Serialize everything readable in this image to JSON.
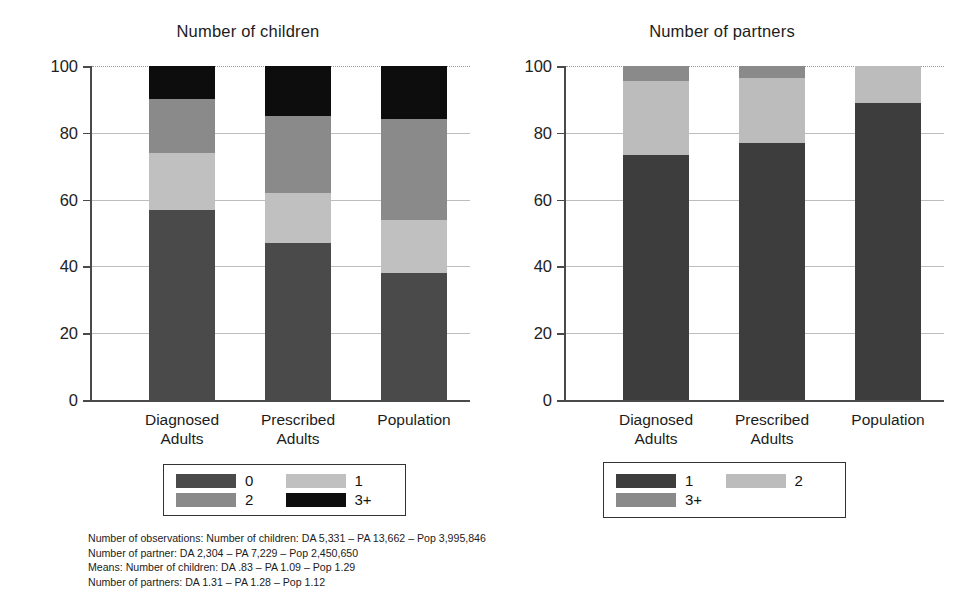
{
  "figure": {
    "width": 969,
    "height": 596,
    "background": "#ffffff"
  },
  "palette": {
    "cat_0_1": "#4a4a4a",
    "cat_1_2": "#c0c0c0",
    "cat_2_3plus": "#8a8a8a",
    "cat_3plus": "#0d0d0d",
    "axis": "#4a4a4a",
    "grid": "#bdbdbd"
  },
  "axis": {
    "tick_labels": [
      "0",
      "20",
      "40",
      "60",
      "80",
      "100"
    ],
    "tick_values": [
      0,
      20,
      40,
      60,
      80,
      100
    ],
    "ylim": [
      0,
      100
    ]
  },
  "categories": [
    "Diagnosed\nAdults",
    "Prescribed\nAdults",
    "Population"
  ],
  "legend_children": {
    "items": [
      {
        "label": "0",
        "color": "#4a4a4a"
      },
      {
        "label": "1",
        "color": "#c0c0c0"
      },
      {
        "label": "2",
        "color": "#8a8a8a"
      },
      {
        "label": "3+",
        "color": "#0d0d0d"
      }
    ]
  },
  "legend_partners": {
    "items": [
      {
        "label": "1",
        "color": "#3d3d3d"
      },
      {
        "label": "2",
        "color": "#bcbcbc"
      },
      {
        "label": "3+",
        "color": "#8a8a8a"
      }
    ]
  },
  "footnote": {
    "line1": "Number of observations: Number of children: DA 5,331 – PA 13,662 – Pop 3,995,846",
    "line2": "Number of partner: DA 2,304 – PA 7,229 – Pop 2,450,650",
    "line3": "Means: Number of children: DA .83 – PA 1.09 – Pop 1.29",
    "line4": "Number of partners: DA 1.31 – PA 1.28 – Pop 1.12"
  },
  "chart_data": [
    {
      "type": "bar",
      "stacked": true,
      "title": "Number of children",
      "xlabel": "",
      "ylabel": "",
      "ylim": [
        0,
        100
      ],
      "grid": true,
      "legend_position": "below",
      "categories": [
        "Diagnosed Adults",
        "Prescribed Adults",
        "Population"
      ],
      "series": [
        {
          "name": "0",
          "color": "#4a4a4a",
          "values": [
            57,
            47,
            38
          ]
        },
        {
          "name": "1",
          "color": "#c0c0c0",
          "values": [
            17,
            15,
            16
          ]
        },
        {
          "name": "2",
          "color": "#8a8a8a",
          "values": [
            16,
            23,
            30
          ]
        },
        {
          "name": "3+",
          "color": "#0d0d0d",
          "values": [
            10,
            15,
            16
          ]
        }
      ],
      "observations": {
        "DA": "5,331",
        "PA": "13,662",
        "Pop": "3,995,846"
      },
      "means": {
        "DA": ".83",
        "PA": "1.09",
        "Pop": "1.29"
      }
    },
    {
      "type": "bar",
      "stacked": true,
      "title": "Number of partners",
      "xlabel": "",
      "ylabel": "",
      "ylim": [
        0,
        100
      ],
      "grid": true,
      "legend_position": "below",
      "categories": [
        "Diagnosed Adults",
        "Prescribed Adults",
        "Population"
      ],
      "series": [
        {
          "name": "1",
          "color": "#3d3d3d",
          "values": [
            73.5,
            77,
            89
          ]
        },
        {
          "name": "2",
          "color": "#bcbcbc",
          "values": [
            22,
            19.5,
            11
          ]
        },
        {
          "name": "3+",
          "color": "#8a8a8a",
          "values": [
            4.5,
            3.5,
            0
          ]
        }
      ],
      "observations": {
        "DA": "2,304",
        "PA": "7,229",
        "Pop": "2,450,650"
      },
      "means": {
        "DA": "1.31",
        "PA": "1.28",
        "Pop": "1.12"
      }
    }
  ]
}
